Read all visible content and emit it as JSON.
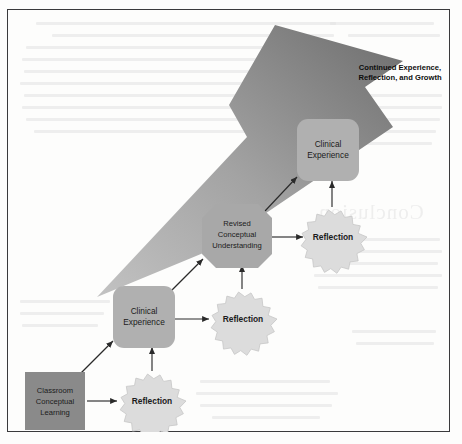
{
  "page": {
    "background_color": "#fdfdfc",
    "border_color": "#3a3a3c",
    "ghost_heading": "Conclusion"
  },
  "diagram": {
    "colors": {
      "start_node": "#8a8a8a",
      "experience_node": "#b0b0b0",
      "understanding_node": "#a8a8a8",
      "reflection_burst_fill": "#dcdcdc",
      "reflection_burst_stroke": "#c6c6c6",
      "connector": "#2a2a2a",
      "growth_arrow_dark": "#6b6b6b",
      "growth_arrow_light": "#bdbdbd",
      "node_text": "#1b1b1b"
    },
    "nodes": [
      {
        "id": "classroom-conceptual-learning",
        "shape": "square",
        "lines": [
          "Classroom",
          "Conceptual",
          "Learning"
        ]
      },
      {
        "id": "reflection-1",
        "shape": "starburst",
        "lines": [
          "Reflection"
        ]
      },
      {
        "id": "clinical-experience-1",
        "shape": "rounded-rect",
        "lines": [
          "Clinical",
          "Experience"
        ]
      },
      {
        "id": "reflection-2",
        "shape": "starburst",
        "lines": [
          "Reflection"
        ]
      },
      {
        "id": "revised-conceptual-understanding",
        "shape": "octagon",
        "lines": [
          "Revised",
          "Conceptual",
          "Understanding"
        ]
      },
      {
        "id": "reflection-3",
        "shape": "starburst",
        "lines": [
          "Reflection"
        ]
      },
      {
        "id": "clinical-experience-2",
        "shape": "rounded-rect",
        "lines": [
          "Clinical",
          "Experience"
        ]
      }
    ],
    "growth_arrow": {
      "id": "continued-growth-arrow",
      "caption_lines": [
        "Continued Experience,",
        "Reflection, and Growth"
      ],
      "direction": "up-right"
    },
    "connectors": [
      {
        "from": "classroom-conceptual-learning",
        "to": "reflection-1",
        "style": "horizontal"
      },
      {
        "from": "reflection-1",
        "to": "clinical-experience-1",
        "style": "vertical-up"
      },
      {
        "from": "classroom-conceptual-learning",
        "to": "clinical-experience-1",
        "style": "diagonal-up-right"
      },
      {
        "from": "clinical-experience-1",
        "to": "reflection-2",
        "style": "horizontal"
      },
      {
        "from": "reflection-2",
        "to": "revised-conceptual-understanding",
        "style": "vertical-up"
      },
      {
        "from": "clinical-experience-1",
        "to": "revised-conceptual-understanding",
        "style": "diagonal-up-right"
      },
      {
        "from": "revised-conceptual-understanding",
        "to": "reflection-3",
        "style": "horizontal"
      },
      {
        "from": "reflection-3",
        "to": "clinical-experience-2",
        "style": "vertical-up"
      },
      {
        "from": "revised-conceptual-understanding",
        "to": "clinical-experience-2",
        "style": "diagonal-up-right"
      }
    ]
  }
}
